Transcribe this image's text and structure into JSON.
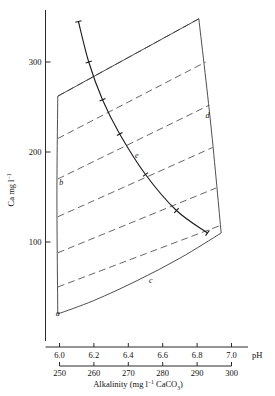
{
  "chart_data": {
    "type": "line",
    "title": "",
    "xlabel": "pH",
    "xlabel_secondary": "Alkalinity (mg l⁻¹ CaCO₃)",
    "ylabel": "Ca mg l⁻¹",
    "xlim": [
      5.88,
      7.02
    ],
    "ylim": [
      0,
      360
    ],
    "xlim_secondary": [
      244,
      301
    ],
    "grid": false,
    "legend": "none",
    "x_ticks": [
      "6.0",
      "6.2",
      "6.4",
      "6.6",
      "6.8",
      "7.0"
    ],
    "x_tick_values": [
      6.0,
      6.2,
      6.4,
      6.6,
      6.8,
      7.0
    ],
    "x_ticks_secondary": [
      "250",
      "260",
      "270",
      "280",
      "290",
      "300"
    ],
    "x_tick_values_secondary": [
      250,
      260,
      270,
      280,
      290,
      300
    ],
    "y_ticks": [
      "100",
      "200",
      "300"
    ],
    "y_tick_values": [
      100,
      200,
      300
    ],
    "annotations": [
      {
        "label": "a",
        "x": 5.99,
        "y": 18
      },
      {
        "label": "b",
        "x": 6.01,
        "y": 163
      },
      {
        "label": "c",
        "x": 6.53,
        "y": 55
      },
      {
        "label": "d",
        "x": 6.86,
        "y": 238
      },
      {
        "label": "e",
        "x": 6.45,
        "y": 193
      }
    ],
    "series": [
      {
        "name": "e",
        "style": "solid",
        "points": [
          {
            "x": 6.11,
            "y": 345
          },
          {
            "x": 6.17,
            "y": 300
          },
          {
            "x": 6.25,
            "y": 258
          },
          {
            "x": 6.35,
            "y": 220
          },
          {
            "x": 6.5,
            "y": 175
          },
          {
            "x": 6.68,
            "y": 135
          },
          {
            "x": 6.86,
            "y": 110
          }
        ],
        "tick_markers": [
          {
            "x": 6.11,
            "y": 345
          },
          {
            "x": 6.17,
            "y": 300
          },
          {
            "x": 6.25,
            "y": 258
          },
          {
            "x": 6.35,
            "y": 220
          },
          {
            "x": 6.5,
            "y": 175
          },
          {
            "x": 6.68,
            "y": 135
          },
          {
            "x": 6.86,
            "y": 110
          }
        ]
      },
      {
        "name": "b",
        "style": "solid",
        "points": [
          {
            "x": 5.99,
            "y": 262
          },
          {
            "x": 5.985,
            "y": 150
          },
          {
            "x": 5.99,
            "y": 20
          }
        ]
      },
      {
        "name": "c",
        "style": "solid",
        "points": [
          {
            "x": 5.99,
            "y": 20
          },
          {
            "x": 6.2,
            "y": 35
          },
          {
            "x": 6.45,
            "y": 57
          },
          {
            "x": 6.7,
            "y": 82
          },
          {
            "x": 6.94,
            "y": 110
          }
        ]
      },
      {
        "name": "d",
        "style": "solid",
        "points": [
          {
            "x": 6.81,
            "y": 348
          },
          {
            "x": 6.88,
            "y": 230
          },
          {
            "x": 6.94,
            "y": 110
          }
        ]
      },
      {
        "name": "top",
        "style": "solid",
        "points": [
          {
            "x": 5.99,
            "y": 262
          },
          {
            "x": 6.81,
            "y": 348
          }
        ]
      }
    ],
    "isolines": [
      {
        "style": "dashed",
        "points": [
          {
            "x": 5.99,
            "y": 262
          },
          {
            "x": 6.81,
            "y": 348
          }
        ]
      },
      {
        "style": "dashed",
        "points": [
          {
            "x": 5.99,
            "y": 215
          },
          {
            "x": 6.85,
            "y": 300
          }
        ]
      },
      {
        "style": "dashed",
        "points": [
          {
            "x": 5.99,
            "y": 170
          },
          {
            "x": 6.87,
            "y": 252
          }
        ]
      },
      {
        "style": "dashed",
        "points": [
          {
            "x": 5.99,
            "y": 128
          },
          {
            "x": 6.89,
            "y": 205
          }
        ]
      },
      {
        "style": "dashed",
        "points": [
          {
            "x": 5.99,
            "y": 88
          },
          {
            "x": 6.91,
            "y": 160
          }
        ]
      },
      {
        "style": "dashed",
        "points": [
          {
            "x": 5.99,
            "y": 50
          },
          {
            "x": 6.93,
            "y": 118
          }
        ]
      }
    ]
  },
  "labels": {
    "y_axis_main": "Ca mg l",
    "y_axis_sup": "−1",
    "x_axis_ph": "pH",
    "x_axis_alk_pre": "Alkalinity (mg l",
    "x_axis_alk_sup": "−1",
    "x_axis_alk_mid": " CaCO",
    "x_axis_alk_sub": "3",
    "x_axis_alk_post": ")"
  },
  "colors": {
    "axis": "#2a2a2a",
    "envelope": "#3a3a3a",
    "isoline": "#555555",
    "curve": "#1a1a1a",
    "background": "#ffffff"
  }
}
